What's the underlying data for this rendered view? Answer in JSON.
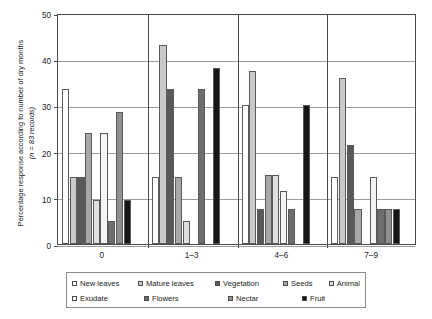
{
  "chart_data": {
    "type": "bar",
    "title": "",
    "xlabel": "",
    "ylabel_line1": "Percentage response according to number of dry months",
    "ylabel_line2": "(n = 83 records)",
    "categories": [
      "0",
      "1–3",
      "4–6",
      "7–9"
    ],
    "ylim": [
      0,
      50
    ],
    "yticks": [
      0,
      10,
      20,
      30,
      40,
      50
    ],
    "ytick_labels": [
      "0",
      "10",
      "20",
      "30",
      "40",
      "50"
    ],
    "grid": true,
    "legend_position": "bottom",
    "series": [
      {
        "name": "New leaves",
        "color": "#ffffff",
        "values": [
          33.5,
          14.5,
          30.0,
          14.5
        ]
      },
      {
        "name": "Mature leaves",
        "color": "#c9c9c9",
        "values": [
          14.5,
          43.0,
          37.5,
          36.0
        ]
      },
      {
        "name": "Vegetation",
        "color": "#595959",
        "values": [
          14.5,
          33.5,
          7.5,
          21.5
        ]
      },
      {
        "name": "Seeds",
        "color": "#a8a8a8",
        "values": [
          24.0,
          14.5,
          15.0,
          7.5
        ]
      },
      {
        "name": "Animal",
        "color": "#e0e0e0",
        "values": [
          9.5,
          5.0,
          15.0,
          0.0
        ]
      },
      {
        "name": "Exudate",
        "color": "#f4f4f4",
        "values": [
          24.0,
          0.0,
          11.5,
          14.5
        ]
      },
      {
        "name": "Flowers",
        "color": "#6e6e6e",
        "values": [
          5.0,
          33.5,
          7.5,
          7.5
        ]
      },
      {
        "name": "Nectar",
        "color": "#8f8f8f",
        "values": [
          28.5,
          0.0,
          0.0,
          7.5
        ]
      },
      {
        "name": "Fruit",
        "color": "#151515",
        "values": [
          9.5,
          38.0,
          30.0,
          7.5
        ]
      }
    ]
  },
  "legend": {
    "row1": [
      "New leaves",
      "Mature leaves",
      "Vegetation",
      "Seeds",
      "Animal"
    ],
    "row2": [
      "Exudate",
      "Flowers",
      "Nectar",
      "Fruit"
    ]
  }
}
